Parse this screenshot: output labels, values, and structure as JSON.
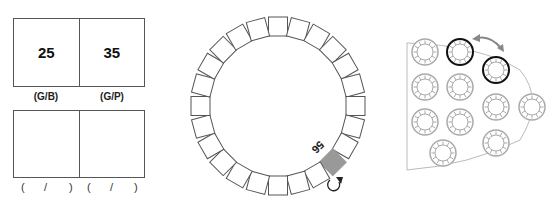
{
  "left_panel": {
    "top_boxes": [
      {
        "value": "25",
        "label": "(G/B)"
      },
      {
        "value": "35",
        "label": "(G/P)"
      }
    ],
    "bottom_boxes": [
      {
        "value": "",
        "label_parts": [
          "(",
          "/",
          ")"
        ]
      },
      {
        "value": "",
        "label_parts": [
          "(",
          "/",
          ")"
        ]
      }
    ]
  },
  "middle_panel": {
    "square_count": 24,
    "shaded_index": 9,
    "shaded_label": "56",
    "shaded_color": "#999999",
    "rotate_icon": "rotate-clockwise-icon"
  },
  "right_panel": {
    "ring_color": "#aaaaaa",
    "highlight_color": "#111111",
    "arrow_icon": "double-arrow-icon",
    "arrow_color": "#888888"
  }
}
